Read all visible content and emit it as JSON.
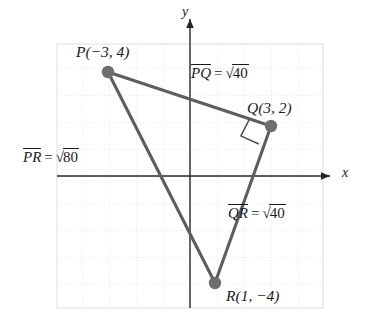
{
  "figure": {
    "type": "coordinate-geometry-diagram",
    "colors": {
      "triangle_stroke": "#595959",
      "vertex_dot": "#6b6b6b",
      "axis": "#262626",
      "grid_minor": "#d8d8e2",
      "grid_major": "#c6c6d4",
      "text": "#1a1a1a",
      "background": "#ffffff"
    },
    "axes": {
      "x_label": "x",
      "y_label": "y",
      "origin_px": {
        "x": 190,
        "y": 176
      },
      "unit_px": 27,
      "x_range": [
        -5,
        5
      ],
      "y_range": [
        -5,
        5
      ],
      "grid": true,
      "grid_style": "dotted"
    },
    "points": [
      {
        "name": "P",
        "label": "P(−3, 4)",
        "x": -3,
        "y": 4,
        "label_pos": "above-left"
      },
      {
        "name": "Q",
        "label": "Q(3, 2)",
        "x": 3,
        "y": 2,
        "label_pos": "above-right"
      },
      {
        "name": "R",
        "label": "R(1, −4)",
        "x": 1,
        "y": -4,
        "label_pos": "below-right"
      }
    ],
    "segments": [
      {
        "name": "PQ",
        "from": "P",
        "to": "Q",
        "label_overline": "PQ",
        "label_equals": "=",
        "label_radicand": "40",
        "label_text": "PQ = √40"
      },
      {
        "name": "PR",
        "from": "P",
        "to": "R",
        "label_overline": "PR",
        "label_equals": "=",
        "label_radicand": "80",
        "label_text": "PR = √80"
      },
      {
        "name": "QR",
        "from": "Q",
        "to": "R",
        "label_overline": "QR",
        "label_equals": "=",
        "label_radicand": "40",
        "label_text": "QR = √40"
      }
    ],
    "right_angle": {
      "at_vertex": "Q",
      "marker": "square",
      "description": "right-angle square marker at vertex Q between segments QP and QR"
    },
    "radical_sign": "√"
  }
}
